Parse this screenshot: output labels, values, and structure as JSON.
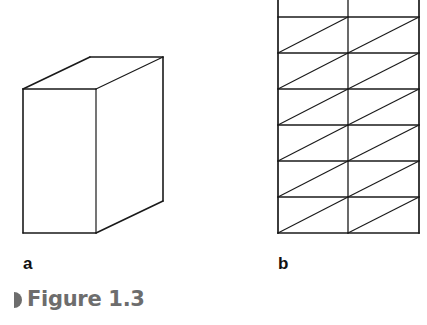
{
  "figure": {
    "caption": "Figure 1.3",
    "caption_color": "#6d6d6d",
    "line_color": "#1a1a1a"
  },
  "panels": [
    {
      "id": "a",
      "label": "a",
      "description": "Oblique-projection rectangular box (cuboid)",
      "box": {
        "front_face": {
          "x1": 23,
          "y1": 89,
          "x2": 96,
          "y2": 233
        },
        "back_offset": {
          "dx": 67,
          "dy": -32
        }
      }
    },
    {
      "id": "b",
      "label": "b",
      "description": "Rectangular grid of 2 columns by 6 rows, each cell split by a diagonal into two triangles",
      "grid": {
        "x_left": 278,
        "x_mid": 348,
        "x_right": 419,
        "y_top": -18,
        "y_bottom": 233,
        "rows_visible": 7,
        "row_height": 36,
        "columns": 2,
        "diagonal_direction": "bottom-left to top-right"
      }
    }
  ]
}
